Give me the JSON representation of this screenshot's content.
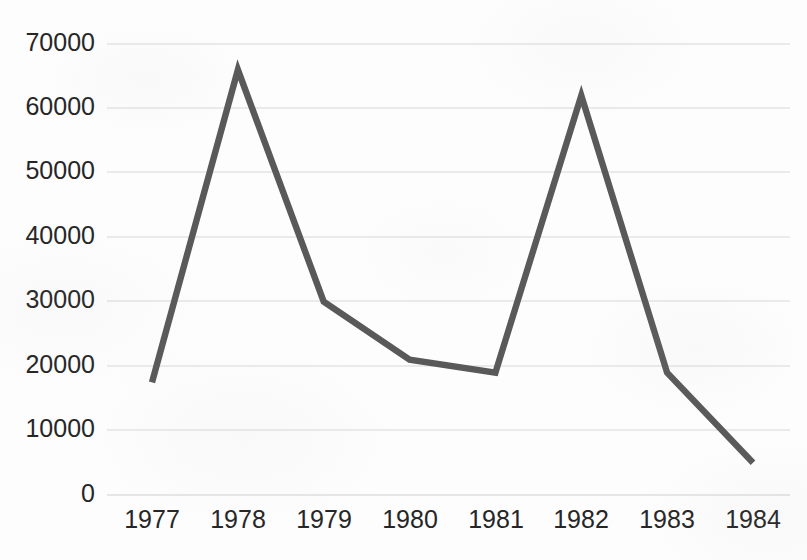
{
  "chart_data": {
    "type": "line",
    "title": "",
    "subtitle": "",
    "xlabel": "",
    "ylabel": "",
    "categories": [
      "1977",
      "1978",
      "1979",
      "1980",
      "1981",
      "1982",
      "1983",
      "1984"
    ],
    "values": [
      17500,
      66000,
      30000,
      21000,
      19000,
      62000,
      19000,
      5000
    ],
    "series": [
      {
        "name": "",
        "values": [
          17500,
          66000,
          30000,
          21000,
          19000,
          62000,
          19000,
          5000
        ]
      }
    ],
    "ylim": [
      0,
      70000
    ],
    "xlim": [
      "1977",
      "1984"
    ],
    "ytick_labels": [
      "0",
      "10000",
      "20000",
      "30000",
      "40000",
      "50000",
      "60000",
      "70000"
    ],
    "ytick_values": [
      0,
      10000,
      20000,
      30000,
      40000,
      50000,
      60000,
      70000
    ],
    "xtick_labels": [
      "1977",
      "1978",
      "1979",
      "1980",
      "1981",
      "1982",
      "1983",
      "1984"
    ],
    "grid": "horizontal",
    "legend": "none",
    "annotations": [],
    "colors": {
      "line": "#595959",
      "gridline": "#d8d8d8",
      "tick_text": "#262626",
      "background": "#fdfdfd"
    }
  }
}
